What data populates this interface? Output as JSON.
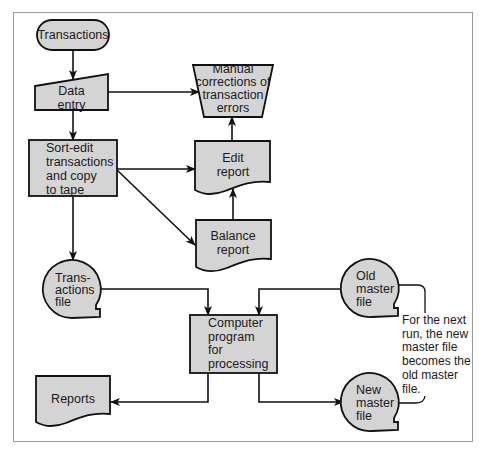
{
  "diagram": {
    "type": "system flowchart",
    "colors": {
      "fill": "#d4d4d4",
      "stroke": "#111111",
      "frame": "#9a9a9a",
      "background": "#ffffff"
    },
    "nodes": [
      {
        "id": "transactions",
        "shape": "terminator",
        "label": "Transactions"
      },
      {
        "id": "data_entry",
        "shape": "manual-input",
        "label": "Data\nentry"
      },
      {
        "id": "manual_corrections",
        "shape": "manual-operation",
        "label": "Manual\ncorrections of\ntransaction\nerrors"
      },
      {
        "id": "sort_edit",
        "shape": "process",
        "label": "Sort-edit\ntransactions\nand copy\nto tape"
      },
      {
        "id": "edit_report",
        "shape": "document",
        "label": "Edit\nreport"
      },
      {
        "id": "balance_report",
        "shape": "document",
        "label": "Balance\nreport"
      },
      {
        "id": "transactions_file",
        "shape": "magnetic-tape",
        "label": "Trans-\nactions\nfile"
      },
      {
        "id": "computer_program",
        "shape": "process",
        "label": "Computer\nprogram\nfor\nprocessing"
      },
      {
        "id": "old_master",
        "shape": "magnetic-tape",
        "label": "Old\nmaster\nfile"
      },
      {
        "id": "new_master",
        "shape": "magnetic-tape",
        "label": "New\nmaster\nfile"
      },
      {
        "id": "reports",
        "shape": "document",
        "label": "Reports"
      }
    ],
    "edges": [
      {
        "from": "transactions",
        "to": "data_entry"
      },
      {
        "from": "data_entry",
        "to": "manual_corrections"
      },
      {
        "from": "data_entry",
        "to": "sort_edit"
      },
      {
        "from": "sort_edit",
        "to": "edit_report"
      },
      {
        "from": "sort_edit",
        "to": "balance_report"
      },
      {
        "from": "sort_edit",
        "to": "transactions_file"
      },
      {
        "from": "edit_report",
        "to": "manual_corrections"
      },
      {
        "from": "balance_report",
        "to": "edit_report"
      },
      {
        "from": "transactions_file",
        "to": "computer_program"
      },
      {
        "from": "old_master",
        "to": "computer_program"
      },
      {
        "from": "computer_program",
        "to": "reports"
      },
      {
        "from": "computer_program",
        "to": "new_master"
      }
    ],
    "annotation": {
      "label": "For the next\nrun, the new\nmaster file\nbecomes the\nold master\nfile."
    }
  }
}
